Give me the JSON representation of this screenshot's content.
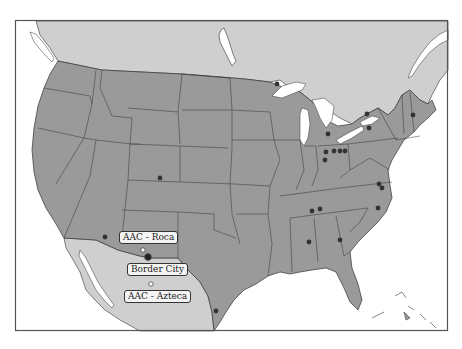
{
  "map": {
    "colors": {
      "ocean": "#ffffff",
      "canada_mexico": "#cfcfcf",
      "usa": "#9a9a9a",
      "border": "#333333",
      "frame": "#555555",
      "dot": "#333333",
      "dot_white": "#ffffff"
    },
    "frame": {
      "x": 15,
      "y": 20,
      "width": 433,
      "height": 311
    },
    "labels": [
      {
        "id": "aac-roca",
        "text": "AAC - Roca",
        "x": 119,
        "y": 231
      },
      {
        "id": "border-city",
        "text": "Border City",
        "x": 127,
        "y": 263
      },
      {
        "id": "aac-azteca",
        "text": "AAC - Azteca",
        "x": 124,
        "y": 290
      }
    ],
    "white_markers": [
      {
        "name": "AAC - Roca",
        "x": 143,
        "y": 250
      },
      {
        "name": "AAC - Azteca",
        "x": 151,
        "y": 284
      }
    ],
    "highlight_marker": {
      "name": "Border City",
      "x": 148,
      "y": 257
    },
    "dots": [
      {
        "region": "Colorado",
        "x": 160,
        "y": 178
      },
      {
        "region": "Arizona",
        "x": 105,
        "y": 237
      },
      {
        "region": "Texas",
        "x": 216,
        "y": 311
      },
      {
        "region": "Minnesota",
        "x": 277,
        "y": 84
      },
      {
        "region": "Michigan",
        "x": 328,
        "y": 134
      },
      {
        "region": "Ohio-1",
        "x": 326,
        "y": 152
      },
      {
        "region": "Ohio-2",
        "x": 334,
        "y": 151
      },
      {
        "region": "Ohio-3",
        "x": 340,
        "y": 151
      },
      {
        "region": "Ohio-4",
        "x": 345,
        "y": 151
      },
      {
        "region": "Indiana",
        "x": 325,
        "y": 160
      },
      {
        "region": "New York-1",
        "x": 367,
        "y": 114
      },
      {
        "region": "New York-2",
        "x": 369,
        "y": 128
      },
      {
        "region": "Vermont",
        "x": 413,
        "y": 115
      },
      {
        "region": "Virginia-1",
        "x": 379,
        "y": 184
      },
      {
        "region": "Virginia-2",
        "x": 382,
        "y": 188
      },
      {
        "region": "North Carolina",
        "x": 378,
        "y": 208
      },
      {
        "region": "Tennessee-1",
        "x": 312,
        "y": 211
      },
      {
        "region": "Tennessee-2",
        "x": 320,
        "y": 209
      },
      {
        "region": "Alabama",
        "x": 309,
        "y": 242
      },
      {
        "region": "Georgia",
        "x": 340,
        "y": 240
      }
    ]
  }
}
